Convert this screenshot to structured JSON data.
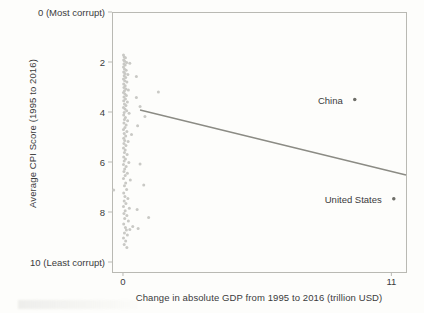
{
  "chart_data": {
    "type": "scatter",
    "title": "",
    "xlabel": "Change in absolute GDP from 1995 to 2016 (trillion USD)",
    "ylabel": "Average CPI Score (1995 to 2016)",
    "xlim": [
      -0.45,
      11.6
    ],
    "ylim": [
      0,
      10.4
    ],
    "y_inverted": true,
    "grid": false,
    "legend": "none",
    "xticks": [
      {
        "value": 0,
        "label": "0"
      },
      {
        "value": 11,
        "label": "11"
      }
    ],
    "yticks": [
      {
        "value": 0,
        "label": "0 (Most corrupt)"
      },
      {
        "value": 2,
        "label": "2"
      },
      {
        "value": 4,
        "label": "4"
      },
      {
        "value": 6,
        "label": "6"
      },
      {
        "value": 8,
        "label": "8"
      },
      {
        "value": 10,
        "label": "10 (Least corrupt)"
      }
    ],
    "marker_color": "#c9c9c5",
    "line_color": "#8b8b84",
    "frame_color": "#b9b9b3",
    "text_color": "#3b3b3b",
    "trendline": {
      "type": "linear",
      "x_start": 0.7,
      "y_start": 3.92,
      "x_end": 11.6,
      "y_end": 6.52
    },
    "annotations": [
      {
        "label": "China",
        "x": 9.5,
        "y": 3.5,
        "label_offset_x": -12
      },
      {
        "label": "United States",
        "x": 11.1,
        "y": 7.47,
        "label_offset_x": -12
      }
    ],
    "points": [
      {
        "x": 0.02,
        "y": 1.72
      },
      {
        "x": 0.05,
        "y": 1.8
      },
      {
        "x": 0.1,
        "y": 1.83
      },
      {
        "x": 0.03,
        "y": 1.92
      },
      {
        "x": 0.07,
        "y": 1.97
      },
      {
        "x": 0.15,
        "y": 2.02
      },
      {
        "x": 0.28,
        "y": 2.05
      },
      {
        "x": 0.04,
        "y": 2.08
      },
      {
        "x": 0.09,
        "y": 2.12
      },
      {
        "x": 0.02,
        "y": 2.2
      },
      {
        "x": 0.06,
        "y": 2.28
      },
      {
        "x": 0.13,
        "y": 2.33
      },
      {
        "x": 0.03,
        "y": 2.4
      },
      {
        "x": 0.08,
        "y": 2.46
      },
      {
        "x": 0.2,
        "y": 2.5
      },
      {
        "x": 0.05,
        "y": 2.55
      },
      {
        "x": 0.11,
        "y": 2.62
      },
      {
        "x": 0.02,
        "y": 2.68
      },
      {
        "x": 0.55,
        "y": 2.58
      },
      {
        "x": 0.07,
        "y": 2.75
      },
      {
        "x": 0.16,
        "y": 2.8
      },
      {
        "x": 0.03,
        "y": 2.88
      },
      {
        "x": 0.09,
        "y": 2.95
      },
      {
        "x": 0.04,
        "y": 3.02
      },
      {
        "x": 0.12,
        "y": 3.08
      },
      {
        "x": 0.06,
        "y": 3.15
      },
      {
        "x": 0.22,
        "y": 3.12
      },
      {
        "x": 0.02,
        "y": 3.22
      },
      {
        "x": 1.45,
        "y": 3.2
      },
      {
        "x": 0.08,
        "y": 3.28
      },
      {
        "x": 0.14,
        "y": 3.34
      },
      {
        "x": 0.04,
        "y": 3.4
      },
      {
        "x": 0.55,
        "y": 3.42
      },
      {
        "x": 0.1,
        "y": 3.48
      },
      {
        "x": 0.03,
        "y": 3.55
      },
      {
        "x": 0.18,
        "y": 3.6
      },
      {
        "x": 0.06,
        "y": 3.68
      },
      {
        "x": 0.12,
        "y": 3.74
      },
      {
        "x": 0.02,
        "y": 3.82
      },
      {
        "x": 0.7,
        "y": 3.78
      },
      {
        "x": 0.08,
        "y": 3.88
      },
      {
        "x": 0.15,
        "y": 3.95
      },
      {
        "x": 0.05,
        "y": 4.02
      },
      {
        "x": 0.25,
        "y": 4.05
      },
      {
        "x": 0.03,
        "y": 4.12
      },
      {
        "x": 0.9,
        "y": 4.18
      },
      {
        "x": 0.1,
        "y": 4.22
      },
      {
        "x": 0.06,
        "y": 4.3
      },
      {
        "x": 0.19,
        "y": 4.35
      },
      {
        "x": 0.04,
        "y": 4.44
      },
      {
        "x": 0.13,
        "y": 4.52
      },
      {
        "x": 0.6,
        "y": 4.55
      },
      {
        "x": 0.08,
        "y": 4.62
      },
      {
        "x": 0.02,
        "y": 4.7
      },
      {
        "x": 0.16,
        "y": 4.78
      },
      {
        "x": 0.05,
        "y": 4.86
      },
      {
        "x": 0.35,
        "y": 4.9
      },
      {
        "x": 0.11,
        "y": 4.96
      },
      {
        "x": 0.03,
        "y": 5.05
      },
      {
        "x": 0.07,
        "y": 5.14
      },
      {
        "x": 0.21,
        "y": 5.18
      },
      {
        "x": 0.04,
        "y": 5.26
      },
      {
        "x": 0.12,
        "y": 5.34
      },
      {
        "x": 0.02,
        "y": 5.44
      },
      {
        "x": 0.09,
        "y": 5.52
      },
      {
        "x": 0.06,
        "y": 5.62
      },
      {
        "x": 0.17,
        "y": 5.7
      },
      {
        "x": 0.03,
        "y": 5.8
      },
      {
        "x": 0.1,
        "y": 5.88
      },
      {
        "x": 0.05,
        "y": 5.96
      },
      {
        "x": 0.24,
        "y": 6.02
      },
      {
        "x": 0.02,
        "y": 6.1
      },
      {
        "x": 0.7,
        "y": 6.08
      },
      {
        "x": 0.13,
        "y": 6.18
      },
      {
        "x": 0.07,
        "y": 6.28
      },
      {
        "x": 0.04,
        "y": 6.38
      },
      {
        "x": 0.18,
        "y": 6.45
      },
      {
        "x": 0.09,
        "y": 6.54
      },
      {
        "x": 0.02,
        "y": 6.66
      },
      {
        "x": 0.3,
        "y": 6.72
      },
      {
        "x": 0.11,
        "y": 6.84
      },
      {
        "x": 0.06,
        "y": 6.95
      },
      {
        "x": -0.38,
        "y": 7.12
      },
      {
        "x": 0.15,
        "y": 7.1
      },
      {
        "x": 0.03,
        "y": 7.24
      },
      {
        "x": 0.85,
        "y": 6.92
      },
      {
        "x": 0.08,
        "y": 7.38
      },
      {
        "x": 0.2,
        "y": 7.46
      },
      {
        "x": 0.05,
        "y": 7.56
      },
      {
        "x": 0.12,
        "y": 7.66
      },
      {
        "x": 0.02,
        "y": 7.78
      },
      {
        "x": 0.26,
        "y": 7.85
      },
      {
        "x": 0.09,
        "y": 7.95
      },
      {
        "x": 0.58,
        "y": 7.9
      },
      {
        "x": 0.04,
        "y": 8.06
      },
      {
        "x": 0.16,
        "y": 8.14
      },
      {
        "x": 0.07,
        "y": 8.26
      },
      {
        "x": 1.05,
        "y": 8.22
      },
      {
        "x": 0.22,
        "y": 8.36
      },
      {
        "x": 0.03,
        "y": 8.48
      },
      {
        "x": 0.4,
        "y": 8.58
      },
      {
        "x": 0.1,
        "y": 8.62
      },
      {
        "x": 0.14,
        "y": 8.72
      },
      {
        "x": 0.62,
        "y": 8.66
      },
      {
        "x": 0.28,
        "y": 8.7
      },
      {
        "x": 0.06,
        "y": 8.84
      },
      {
        "x": 0.18,
        "y": 8.92
      },
      {
        "x": 0.02,
        "y": 9.04
      },
      {
        "x": 0.11,
        "y": 9.16
      },
      {
        "x": 0.05,
        "y": 9.3
      },
      {
        "x": 0.16,
        "y": 9.42
      },
      {
        "x": 9.5,
        "y": 3.5
      },
      {
        "x": 11.1,
        "y": 7.47
      }
    ]
  }
}
